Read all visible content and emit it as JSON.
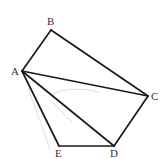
{
  "diagram": {
    "type": "geometry",
    "line_color": "#1a1a1a",
    "points": [
      {
        "name": "A",
        "x": 22,
        "y": 71,
        "label_x": 11,
        "label_y": 75
      },
      {
        "name": "B",
        "x": 51,
        "y": 30,
        "label_x": 47,
        "label_y": 25
      },
      {
        "name": "C",
        "x": 148,
        "y": 96,
        "label_x": 151,
        "label_y": 100
      },
      {
        "name": "D",
        "x": 114,
        "y": 146,
        "label_x": 110,
        "label_y": 157
      },
      {
        "name": "E",
        "x": 59,
        "y": 146,
        "label_x": 55,
        "label_y": 157
      }
    ],
    "segments": [
      {
        "from": "A",
        "to": "B"
      },
      {
        "from": "B",
        "to": "C"
      },
      {
        "from": "C",
        "to": "D"
      },
      {
        "from": "D",
        "to": "E"
      },
      {
        "from": "E",
        "to": "A"
      },
      {
        "from": "A",
        "to": "C"
      },
      {
        "from": "A",
        "to": "D"
      }
    ],
    "labels": {
      "A": "A",
      "B": "B",
      "C": "C",
      "D": "D",
      "E": "E"
    }
  }
}
